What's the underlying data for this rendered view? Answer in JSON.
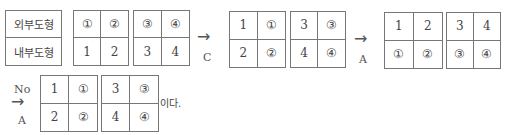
{
  "labels": {
    "outer": "외부도형",
    "inner": "내부도형"
  },
  "row1": {
    "grid1": [
      "①",
      "②",
      "1",
      "2"
    ],
    "grid2": [
      "③",
      "④",
      "3",
      "4"
    ],
    "arrow1": {
      "glyph": "→",
      "op": "C"
    },
    "grid3": [
      "1",
      "①",
      "2",
      "②"
    ],
    "grid4": [
      "3",
      "③",
      "4",
      "④"
    ],
    "arrow2": {
      "glyph": "→",
      "op": "A"
    },
    "grid5": [
      "1",
      "2",
      "①",
      "②"
    ],
    "grid6": [
      "3",
      "4",
      "③",
      "④"
    ]
  },
  "row2": {
    "arrow": {
      "top": "No",
      "glyph": "→",
      "op": "A"
    },
    "grid7": [
      "1",
      "①",
      "2",
      "②"
    ],
    "grid8": [
      "3",
      "③",
      "4",
      "④"
    ],
    "tail": "이다."
  }
}
